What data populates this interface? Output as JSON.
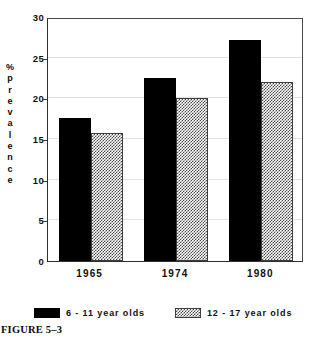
{
  "figure": {
    "caption": "FIGURE 5–3"
  },
  "chart_data": {
    "type": "bar",
    "title": "",
    "subtitle": "",
    "xlabel": "",
    "ylabel": "% prevalence",
    "ylabel_chars": [
      "%",
      "p",
      "r",
      "e",
      "v",
      "a",
      "l",
      "e",
      "n",
      "c",
      "e"
    ],
    "categories": [
      "1965",
      "1974",
      "1980"
    ],
    "series": [
      {
        "name": "6 - 11 year olds",
        "values": [
          17.6,
          22.5,
          27.2
        ],
        "color": "#000000",
        "fill": "solid-black"
      },
      {
        "name": "12 - 17 year olds",
        "values": [
          15.8,
          20.1,
          22.0
        ],
        "color": "#4d4d4d",
        "fill": "checkerboard-gray"
      }
    ],
    "ylim": [
      0,
      30
    ],
    "ytick_values": [
      0,
      5,
      10,
      15,
      20,
      25,
      30
    ],
    "ytick_labels": [
      "0",
      "5",
      "10",
      "15",
      "20",
      "25",
      "30"
    ],
    "grid": true,
    "grid_axis": "y",
    "grid_color": "#e3e3e3",
    "legend_position": "below",
    "annotations": []
  },
  "legend": {
    "entries": [
      {
        "label": "6 - 11 year olds"
      },
      {
        "label": "12 - 17 year olds"
      }
    ]
  }
}
